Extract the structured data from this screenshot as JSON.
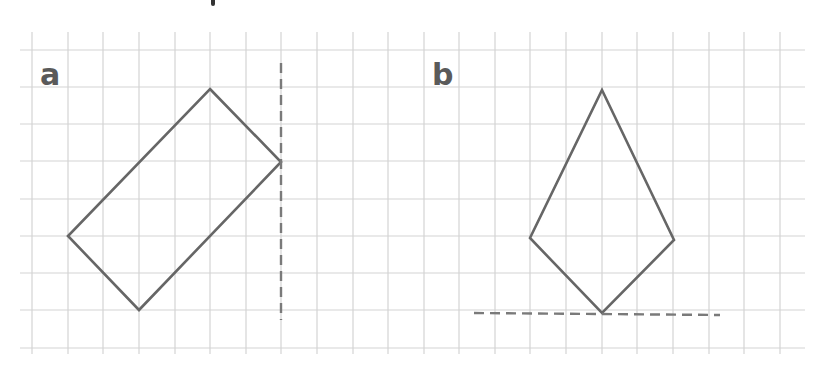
{
  "diagram": {
    "type": "grid-symmetry-exercise",
    "grid": {
      "x_start": 32,
      "x_end": 805,
      "y_start": 50,
      "y_end": 348,
      "cell": 35.6,
      "vertical_lines_x": [
        32,
        68,
        103,
        139,
        175,
        210,
        246,
        281,
        317,
        353,
        388,
        424,
        459,
        495,
        530,
        566,
        602,
        637,
        673,
        709,
        744,
        780
      ],
      "horizontal_lines_y": [
        50,
        87,
        124,
        161,
        199,
        236,
        273,
        310,
        348
      ],
      "color": "#d4d4d4"
    },
    "shape_color": "#666666",
    "dash_color": "#7a7a7a",
    "panels": [
      {
        "label": "a",
        "label_pos": [
          40,
          60
        ],
        "shape": "rectangle",
        "vertices": [
          [
            210,
            89
          ],
          [
            281,
            162
          ],
          [
            139,
            310
          ],
          [
            68,
            236
          ]
        ],
        "mirror_line": {
          "orientation": "vertical",
          "from": [
            281,
            63
          ],
          "to": [
            281,
            320
          ]
        }
      },
      {
        "label": "b",
        "label_pos": [
          432,
          60
        ],
        "shape": "kite",
        "vertices": [
          [
            602,
            90
          ],
          [
            674,
            240
          ],
          [
            602,
            313
          ],
          [
            530,
            238
          ]
        ],
        "mirror_line": {
          "orientation": "horizontal",
          "from": [
            474,
            313
          ],
          "to": [
            720,
            315
          ]
        }
      }
    ]
  }
}
